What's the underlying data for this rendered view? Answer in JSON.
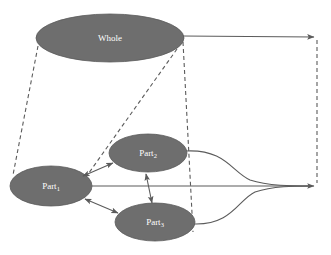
{
  "diagram": {
    "background_color": "#ffffff",
    "node_fill_color": "#6e6e6e",
    "node_label_color": "#ffffff",
    "edge_color": "#5b5b5b",
    "nodes": [
      {
        "id": "whole",
        "label_base": "Whole",
        "label_sub": "",
        "cx": 110,
        "cy": 38,
        "rx": 74,
        "ry": 24
      },
      {
        "id": "part1",
        "label_base": "Part",
        "label_sub": "1",
        "cx": 51,
        "cy": 186,
        "rx": 41,
        "ry": 20
      },
      {
        "id": "part2",
        "label_base": "Part",
        "label_sub": "2",
        "cx": 148,
        "cy": 153,
        "rx": 39,
        "ry": 19
      },
      {
        "id": "part3",
        "label_base": "Part",
        "label_sub": "3",
        "cx": 155,
        "cy": 222,
        "rx": 40,
        "ry": 19
      }
    ],
    "edges": [
      {
        "id": "whole-to-right-arrow",
        "kind": "solid-arrow",
        "from": "whole",
        "to": "right-top-terminal"
      },
      {
        "id": "part1-to-right-arrow",
        "kind": "solid-arrow",
        "from": "part1",
        "to": "right-bottom-terminal"
      },
      {
        "id": "part2-curve-to-right",
        "kind": "curve",
        "from": "part2",
        "to": "right-bottom-terminal"
      },
      {
        "id": "part3-curve-to-right",
        "kind": "curve",
        "from": "part3",
        "to": "right-bottom-terminal"
      },
      {
        "id": "whole-left-to-part1",
        "kind": "dashed",
        "from": "whole",
        "to": "part1"
      },
      {
        "id": "whole-right-to-part1-part2-gap",
        "kind": "dashed",
        "from": "whole",
        "to": "part1"
      },
      {
        "id": "whole-right-to-part3",
        "kind": "dashed",
        "from": "whole",
        "to": "part3"
      },
      {
        "id": "right-top-to-right-bottom",
        "kind": "dashed-vertical",
        "from": "right-top-terminal",
        "to": "right-bottom-terminal"
      },
      {
        "id": "part1-part2-bidirectional",
        "kind": "double-arrow",
        "from": "part1",
        "to": "part2"
      },
      {
        "id": "part1-part3-bidirectional",
        "kind": "double-arrow",
        "from": "part1",
        "to": "part3"
      },
      {
        "id": "part2-part3-bidirectional",
        "kind": "double-arrow",
        "from": "part2",
        "to": "part3"
      }
    ],
    "terminals": [
      {
        "id": "right-top-terminal",
        "x": 317,
        "y": 37
      },
      {
        "id": "right-bottom-terminal",
        "x": 317,
        "y": 186
      }
    ]
  }
}
